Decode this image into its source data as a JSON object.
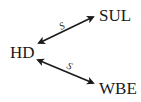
{
  "diagram": {
    "nodes": [
      {
        "id": "HD",
        "label": "HD"
      },
      {
        "id": "SUL",
        "label": "SUL"
      },
      {
        "id": "WBE",
        "label": "WBE"
      }
    ],
    "edges": [
      {
        "from": "HD",
        "to": "SUL",
        "label": "S",
        "direction": "bidirectional"
      },
      {
        "from": "HD",
        "to": "WBE",
        "label": "S",
        "direction": "bidirectional"
      }
    ],
    "colors": {
      "line": "#1a1a1a",
      "text": "#1a1a1a",
      "background": "#ffffff"
    }
  }
}
